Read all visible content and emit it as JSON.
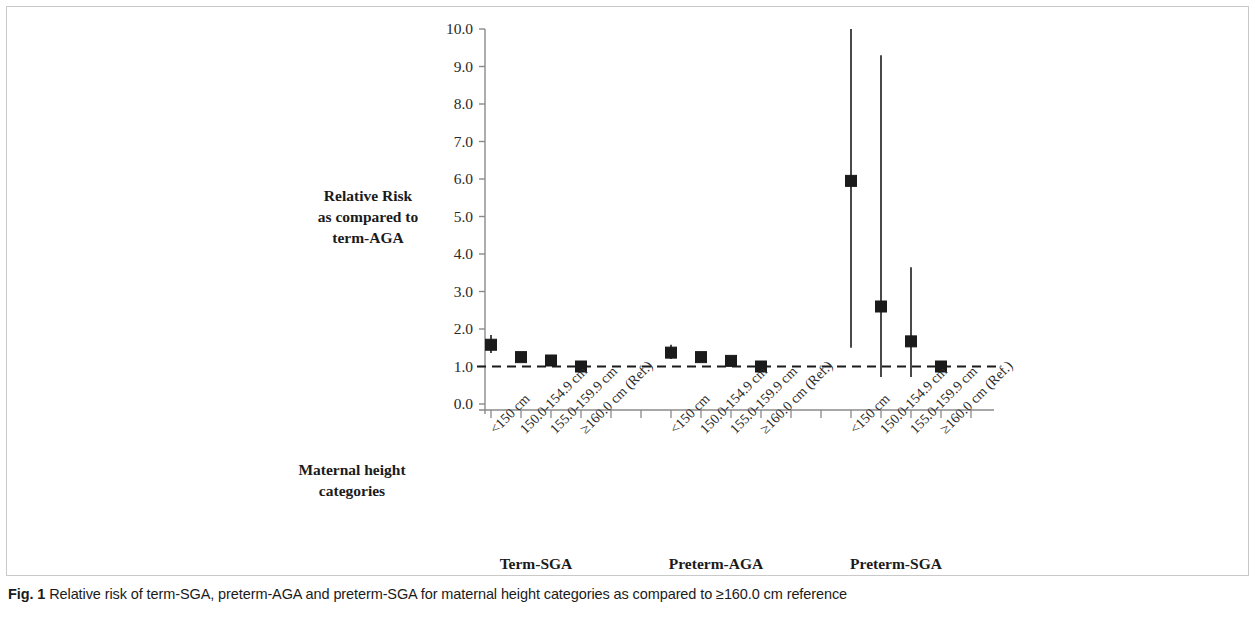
{
  "figure": {
    "caption_label": "Fig. 1",
    "caption_text": "Relative risk of term-SGA, preterm-AGA and preterm-SGA for maternal height categories as compared to ≥160.0 cm reference"
  },
  "chart_data": {
    "type": "scatter",
    "title": "",
    "xlabel": "Maternal height categories",
    "ylabel": "Relative Risk as compared to term-AGA",
    "ylabel_lines": [
      "Relative Risk",
      "as compared to",
      "term-AGA"
    ],
    "xlabel_lines": [
      "Maternal height",
      "categories"
    ],
    "ylim": [
      0.0,
      10.0
    ],
    "yticks": [
      "0.0",
      "1.0",
      "2.0",
      "3.0",
      "4.0",
      "5.0",
      "6.0",
      "7.0",
      "8.0",
      "9.0",
      "10.0"
    ],
    "ytick_values": [
      0.0,
      1.0,
      2.0,
      3.0,
      4.0,
      5.0,
      6.0,
      7.0,
      8.0,
      9.0,
      10.0
    ],
    "grid": false,
    "legend": "none",
    "reference_line": {
      "value": 1.0,
      "style": "dashed",
      "color": "#1b1b1b"
    },
    "marker": {
      "shape": "square",
      "color": "#1b1b1b",
      "size": 11
    },
    "errorbar": {
      "color": "#1b1b1b",
      "width": 1.6,
      "style": "line-no-caps"
    },
    "categories": [
      "<150 cm",
      "150.0-154.9 cm",
      "155.0-159.9 cm",
      "≥160.0 cm (Ref.)"
    ],
    "groups": [
      {
        "name": "Term-SGA",
        "points": [
          {
            "category": "<150 cm",
            "x_tick": 1,
            "value": 1.58,
            "ci_low": 1.36,
            "ci_high": 1.84
          },
          {
            "category": "150.0-154.9 cm",
            "x_tick": 2,
            "value": 1.25,
            "ci_low": 1.16,
            "ci_high": 1.34
          },
          {
            "category": "155.0-159.9 cm",
            "x_tick": 3,
            "value": 1.16,
            "ci_low": 1.1,
            "ci_high": 1.23
          },
          {
            "category": "≥160.0 cm (Ref.)",
            "x_tick": 4,
            "value": 1.0,
            "ci_low": 1.0,
            "ci_high": 1.0
          }
        ]
      },
      {
        "name": "Preterm-AGA",
        "points": [
          {
            "category": "<150 cm",
            "x_tick": 7,
            "value": 1.37,
            "ci_low": 1.2,
            "ci_high": 1.58
          },
          {
            "category": "150.0-154.9 cm",
            "x_tick": 8,
            "value": 1.25,
            "ci_low": 1.16,
            "ci_high": 1.34
          },
          {
            "category": "155.0-159.9 cm",
            "x_tick": 9,
            "value": 1.15,
            "ci_low": 1.08,
            "ci_high": 1.22
          },
          {
            "category": "≥160.0 cm (Ref.)",
            "x_tick": 10,
            "value": 1.0,
            "ci_low": 1.0,
            "ci_high": 1.0
          }
        ]
      },
      {
        "name": "Preterm-SGA",
        "points": [
          {
            "category": "<150 cm",
            "x_tick": 13,
            "value": 5.95,
            "ci_low": 1.5,
            "ci_high": 10.0,
            "ci_high_clipped": true
          },
          {
            "category": "150.0-154.9 cm",
            "x_tick": 14,
            "value": 2.6,
            "ci_low": 0.72,
            "ci_high": 9.3
          },
          {
            "category": "155.0-159.9 cm",
            "x_tick": 15,
            "value": 1.67,
            "ci_low": 0.72,
            "ci_high": 3.65
          },
          {
            "category": "≥160.0 cm (Ref.)",
            "x_tick": 16,
            "value": 1.0,
            "ci_low": 1.0,
            "ci_high": 1.0
          }
        ]
      }
    ],
    "x_tick_labels": [
      {
        "x_tick": 1,
        "label": "<150 cm"
      },
      {
        "x_tick": 2,
        "label": "150.0-154.9 cm"
      },
      {
        "x_tick": 3,
        "label": "155.0-159.9 cm"
      },
      {
        "x_tick": 4,
        "label": "≥160.0 cm (Ref.)"
      },
      {
        "x_tick": 7,
        "label": "<150 cm"
      },
      {
        "x_tick": 8,
        "label": "150.0-154.9 cm"
      },
      {
        "x_tick": 9,
        "label": "155.0-159.9 cm"
      },
      {
        "x_tick": 10,
        "label": "≥160.0 cm (Ref.)"
      },
      {
        "x_tick": 13,
        "label": "<150 cm"
      },
      {
        "x_tick": 14,
        "label": "150.0-154.9 cm"
      },
      {
        "x_tick": 15,
        "label": "155.0-159.9 cm"
      },
      {
        "x_tick": 16,
        "label": "≥160.0 cm (Ref.)"
      }
    ],
    "group_labels": [
      "Term-SGA",
      "Preterm-AGA",
      "Preterm-SGA"
    ],
    "axis_color": "#8a8a8a",
    "text_color": "#1b1b1b"
  }
}
